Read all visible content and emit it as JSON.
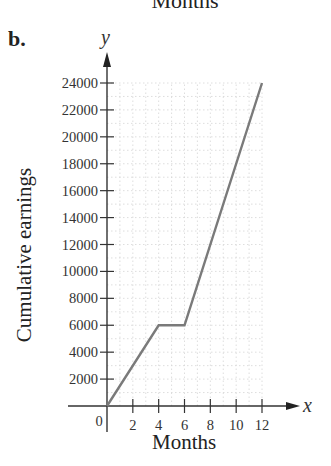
{
  "header": {
    "top_cut_text": "Months",
    "part_label": "b."
  },
  "chart_data": {
    "type": "line",
    "title": "",
    "xlabel": "Months",
    "ylabel": "Cumulative earnings",
    "x_axis_var": "x",
    "y_axis_var": "y",
    "x": [
      0,
      4,
      6,
      12
    ],
    "series": [
      {
        "name": "Cumulative earnings",
        "values": [
          0,
          6000,
          6000,
          24000
        ]
      }
    ],
    "xlim": [
      0,
      12
    ],
    "ylim": [
      0,
      24000
    ],
    "x_ticks": [
      2,
      4,
      6,
      8,
      10,
      12
    ],
    "y_ticks": [
      2000,
      4000,
      6000,
      8000,
      10000,
      12000,
      14000,
      16000,
      18000,
      20000,
      22000,
      24000
    ],
    "origin_label": "0",
    "grid": true,
    "line_color": "#7a7a7a",
    "grid_color": "#d6d6d6"
  }
}
